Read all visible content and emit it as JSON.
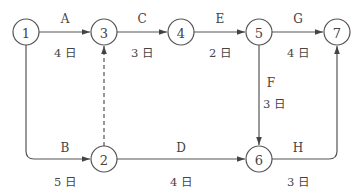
{
  "diagram": {
    "type": "activity-on-arrow network",
    "nodes": [
      {
        "id": "1",
        "label": "1",
        "x": 26,
        "y": 32
      },
      {
        "id": "3",
        "label": "3",
        "x": 104,
        "y": 32
      },
      {
        "id": "4",
        "label": "4",
        "x": 181,
        "y": 32
      },
      {
        "id": "5",
        "label": "5",
        "x": 259,
        "y": 32
      },
      {
        "id": "7",
        "label": "7",
        "x": 337,
        "y": 32
      },
      {
        "id": "2",
        "label": "2",
        "x": 104,
        "y": 159
      },
      {
        "id": "6",
        "label": "6",
        "x": 259,
        "y": 159
      }
    ],
    "activities": [
      {
        "name": "A",
        "from": "1",
        "to": "3",
        "duration": "4 日"
      },
      {
        "name": "C",
        "from": "3",
        "to": "4",
        "duration": "3 日"
      },
      {
        "name": "E",
        "from": "4",
        "to": "5",
        "duration": "2 日"
      },
      {
        "name": "G",
        "from": "5",
        "to": "7",
        "duration": "4 日"
      },
      {
        "name": "B",
        "from": "1",
        "to": "2",
        "duration": "5 日"
      },
      {
        "name": "D",
        "from": "2",
        "to": "6",
        "duration": "4 日"
      },
      {
        "name": "F",
        "from": "5",
        "to": "6",
        "duration": "3 日"
      },
      {
        "name": "H",
        "from": "6",
        "to": "7",
        "duration": "3 日"
      },
      {
        "name": "",
        "from": "2",
        "to": "3",
        "duration": "",
        "dummy": true
      }
    ],
    "colors": {
      "line": "#555555",
      "text": "#444444",
      "background": "#ffffff"
    }
  }
}
